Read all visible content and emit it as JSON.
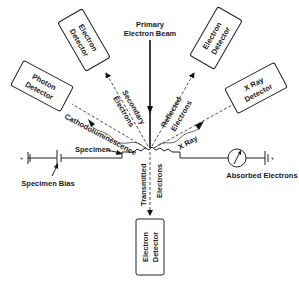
{
  "primary_beam": {
    "line1": "Primary",
    "line2": "Electron Beam"
  },
  "detectors": {
    "secondary_detector": {
      "line1": "Electron",
      "line2": "Detector"
    },
    "reflected_detector": {
      "line1": "Electron",
      "line2": "Detector"
    },
    "photon_detector": {
      "line1": "Photon",
      "line2": "Detector"
    },
    "xray_detector": {
      "line1": "X Ray",
      "line2": "Detector"
    },
    "transmitted_detector": {
      "line1": "Electron",
      "line2": "Detector"
    }
  },
  "signals": {
    "secondary": {
      "line1": "Secondary",
      "line2": "Electrons"
    },
    "reflected": {
      "line1": "Reflected",
      "line2": "Electrons"
    },
    "cathodoluminescence": "Cathodoluminescence",
    "xray": "X Ray",
    "transmitted": {
      "line1": "Transmitted",
      "line2": "Electrons"
    }
  },
  "specimen_label": "Specimen",
  "specimen_bias_label": "Specimen Bias",
  "absorbed_label": "Absorbed Electrons",
  "colors": {
    "ink": "#1a1a1a",
    "background": "#ffffff"
  }
}
